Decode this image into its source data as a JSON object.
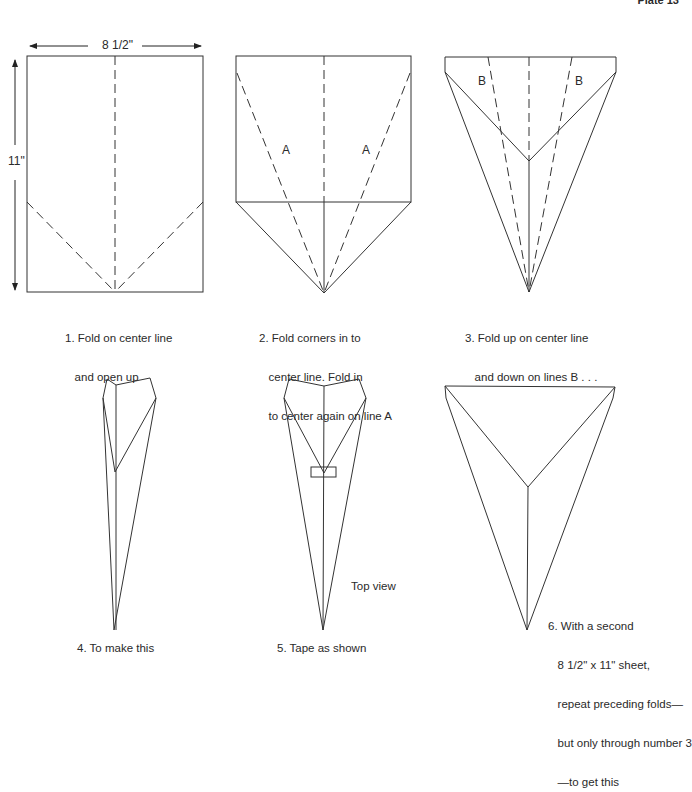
{
  "header": {
    "plate_label": "Plate 13"
  },
  "dimensions": {
    "width_label": "8 1/2\"",
    "height_label": "11\""
  },
  "fold_labels": {
    "a": "A",
    "b": "B"
  },
  "steps": [
    {
      "number": 1,
      "caption_line1": "1. Fold on center line",
      "caption_line2": "   and open up",
      "caption_line3": ""
    },
    {
      "number": 2,
      "caption_line1": "2. Fold corners in to",
      "caption_line2": "   center line. Fold in",
      "caption_line3": "   to center again on line A"
    },
    {
      "number": 3,
      "caption_line1": "3. Fold up on center line",
      "caption_line2": "   and down on lines B . . .",
      "caption_line3": ""
    },
    {
      "number": 4,
      "caption_line1": "4. To make this"
    },
    {
      "number": 5,
      "caption_line1": "5. Tape as shown",
      "note": "Top view"
    },
    {
      "number": 6,
      "caption_lines": [
        "6. With a second",
        "   8 1/2\" x 11\" sheet,",
        "   repeat preceding folds—",
        "   but only through number 3",
        "   —to get this"
      ]
    }
  ],
  "colors": {
    "line": "#333333",
    "background": "#ffffff"
  }
}
